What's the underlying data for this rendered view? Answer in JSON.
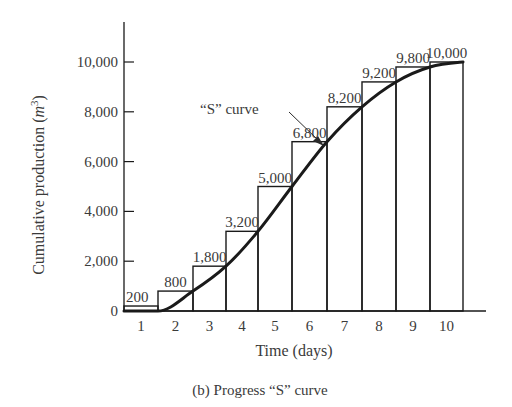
{
  "chart_data": {
    "type": "bar",
    "subtype": "step-bar-with-s-curve",
    "title": "",
    "caption": "(b)  Progress “S” curve",
    "xlabel": "Time (days)",
    "ylabel": "Cumulative production (m³)",
    "ylabel_base": "Cumulative production (",
    "ylabel_unit": "m",
    "ylabel_sup": "3",
    "ylabel_close": ")",
    "categories": [
      "1",
      "2",
      "3",
      "4",
      "5",
      "6",
      "7",
      "8",
      "9",
      "10"
    ],
    "values": [
      200,
      800,
      1800,
      3200,
      5000,
      6800,
      8200,
      9200,
      9800,
      10000
    ],
    "value_labels": [
      "200",
      "800",
      "1,800",
      "3,200",
      "5,000",
      "6,800",
      "8,200",
      "9,200",
      "9,800",
      "10,000"
    ],
    "yticks": [
      0,
      2000,
      4000,
      6000,
      8000,
      10000
    ],
    "ytick_labels": [
      "0",
      "2,000",
      "4,000",
      "6,000",
      "8,000",
      "10,000"
    ],
    "ylim": [
      0,
      11000
    ],
    "grid": false,
    "legend": null,
    "annotations": [
      {
        "text": "“S” curve",
        "points_to": "curve at end of day 6 (6,800)"
      }
    ],
    "series": [
      {
        "name": "Daily cumulative production (bars)",
        "type": "bar",
        "values": [
          200,
          800,
          1800,
          3200,
          5000,
          6800,
          8200,
          9200,
          9800,
          10000
        ]
      },
      {
        "name": "S curve",
        "type": "line",
        "x": [
          1.5,
          2.5,
          3.5,
          4.5,
          5.5,
          6.5,
          7.5,
          8.5,
          9.5,
          10.5
        ],
        "values": [
          0,
          800,
          1800,
          3200,
          5000,
          6800,
          8200,
          9200,
          9800,
          10000
        ]
      }
    ],
    "colors": {
      "ink": "#1a1a1a",
      "text": "#3a3a3a",
      "background": "#ffffff"
    }
  }
}
